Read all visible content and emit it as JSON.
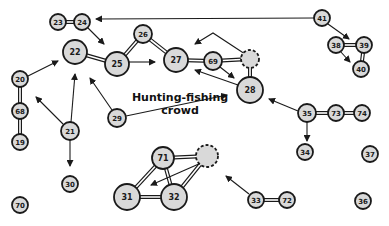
{
  "diagram": {
    "title": "Hunting-fishing crowd",
    "label_lines": [
      "Hunting-fishing",
      "crowd"
    ],
    "colors": {
      "node_fill": "#d9d9d9",
      "stroke": "#1a1a1a",
      "background": "#ffffff"
    },
    "nodes": [
      {
        "id": "23",
        "label": "23",
        "x": 58,
        "y": 22,
        "r": 8
      },
      {
        "id": "24",
        "label": "24",
        "x": 82,
        "y": 22,
        "r": 8
      },
      {
        "id": "41",
        "label": "41",
        "x": 322,
        "y": 18,
        "r": 8
      },
      {
        "id": "38",
        "label": "38",
        "x": 336,
        "y": 45,
        "r": 8
      },
      {
        "id": "39",
        "label": "39",
        "x": 364,
        "y": 45,
        "r": 8
      },
      {
        "id": "40",
        "label": "40",
        "x": 361,
        "y": 69,
        "r": 8
      },
      {
        "id": "22",
        "label": "22",
        "x": 75,
        "y": 52,
        "r": 12
      },
      {
        "id": "25",
        "label": "25",
        "x": 117,
        "y": 64,
        "r": 12
      },
      {
        "id": "26",
        "label": "26",
        "x": 143,
        "y": 34,
        "r": 9
      },
      {
        "id": "27",
        "label": "27",
        "x": 176,
        "y": 60,
        "r": 12
      },
      {
        "id": "69",
        "label": "69",
        "x": 213,
        "y": 61,
        "r": 9
      },
      {
        "id": "dashed-a",
        "label": "",
        "x": 250,
        "y": 59,
        "r": 9,
        "dashed": true
      },
      {
        "id": "28",
        "label": "28",
        "x": 250,
        "y": 90,
        "r": 13
      },
      {
        "id": "20",
        "label": "20",
        "x": 20,
        "y": 79,
        "r": 8
      },
      {
        "id": "68",
        "label": "68",
        "x": 20,
        "y": 111,
        "r": 8
      },
      {
        "id": "19",
        "label": "19",
        "x": 20,
        "y": 142,
        "r": 8
      },
      {
        "id": "21",
        "label": "21",
        "x": 70,
        "y": 131,
        "r": 9
      },
      {
        "id": "29",
        "label": "29",
        "x": 117,
        "y": 118,
        "r": 9
      },
      {
        "id": "30",
        "label": "30",
        "x": 70,
        "y": 184,
        "r": 8
      },
      {
        "id": "70",
        "label": "70",
        "x": 20,
        "y": 205,
        "r": 8
      },
      {
        "id": "35",
        "label": "35",
        "x": 307,
        "y": 113,
        "r": 9
      },
      {
        "id": "73",
        "label": "73",
        "x": 336,
        "y": 113,
        "r": 8
      },
      {
        "id": "74",
        "label": "74",
        "x": 362,
        "y": 113,
        "r": 8
      },
      {
        "id": "34",
        "label": "34",
        "x": 305,
        "y": 152,
        "r": 8
      },
      {
        "id": "37",
        "label": "37",
        "x": 370,
        "y": 154,
        "r": 8
      },
      {
        "id": "71",
        "label": "71",
        "x": 163,
        "y": 158,
        "r": 11
      },
      {
        "id": "dashed-b",
        "label": "",
        "x": 207,
        "y": 156,
        "r": 11,
        "dashed": true
      },
      {
        "id": "31",
        "label": "31",
        "x": 127,
        "y": 197,
        "r": 13
      },
      {
        "id": "32",
        "label": "32",
        "x": 174,
        "y": 197,
        "r": 13
      },
      {
        "id": "33",
        "label": "33",
        "x": 256,
        "y": 200,
        "r": 8
      },
      {
        "id": "72",
        "label": "72",
        "x": 287,
        "y": 200,
        "r": 8
      },
      {
        "id": "36",
        "label": "36",
        "x": 363,
        "y": 201,
        "r": 8
      }
    ],
    "mutual_links": [
      [
        "23",
        "24"
      ],
      [
        "38",
        "39"
      ],
      [
        "39",
        "40"
      ],
      [
        "22",
        "25"
      ],
      [
        "25",
        "26"
      ],
      [
        "26",
        "27"
      ],
      [
        "27",
        "69"
      ],
      [
        "69",
        "dashed-a"
      ],
      [
        "dashed-a",
        "28"
      ],
      [
        "20",
        "68"
      ],
      [
        "68",
        "19"
      ],
      [
        "35",
        "73"
      ],
      [
        "73",
        "74"
      ],
      [
        "71",
        "dashed-b"
      ],
      [
        "71",
        "31"
      ],
      [
        "71",
        "32"
      ],
      [
        "31",
        "32"
      ],
      [
        "32",
        "dashed-b"
      ],
      [
        "33",
        "72"
      ]
    ],
    "arrows": [
      {
        "from": [
          314,
          18
        ],
        "to": [
          96,
          19
        ]
      },
      {
        "from": [
          88,
          28
        ],
        "to": [
          104,
          44
        ]
      },
      {
        "from": [
          328,
          24
        ],
        "to": [
          349,
          39
        ]
      },
      {
        "from": [
          340,
          51
        ],
        "to": [
          350,
          62
        ]
      },
      {
        "from": [
          129,
          62
        ],
        "to": [
          155,
          62
        ]
      },
      {
        "from": [
          28,
          76
        ],
        "to": [
          58,
          61
        ]
      },
      {
        "from": [
          63,
          124
        ],
        "to": [
          36,
          97
        ]
      },
      {
        "from": [
          71,
          122
        ],
        "to": [
          75,
          74
        ]
      },
      {
        "from": [
          70,
          140
        ],
        "to": [
          70,
          166
        ]
      },
      {
        "from": [
          112,
          110
        ],
        "to": [
          90,
          78
        ]
      },
      {
        "from": [
          126,
          116
        ],
        "to": [
          227,
          95
        ]
      },
      {
        "from": [
          245,
          54
        ],
        "to": [
          213,
          33
        ],
        "via": [
          213,
          33
        ],
        "to2": [
          195,
          44
        ]
      },
      {
        "from": [
          220,
          67
        ],
        "to": [
          234,
          78
        ]
      },
      {
        "from": [
          238,
          85
        ],
        "to": [
          195,
          70
        ]
      },
      {
        "from": [
          298,
          111
        ],
        "to": [
          269,
          99
        ]
      },
      {
        "from": [
          307,
          122
        ],
        "to": [
          307,
          141
        ]
      },
      {
        "from": [
          201,
          163
        ],
        "to": [
          151,
          185
        ]
      },
      {
        "from": [
          249,
          194
        ],
        "to": [
          226,
          176
        ]
      }
    ]
  }
}
